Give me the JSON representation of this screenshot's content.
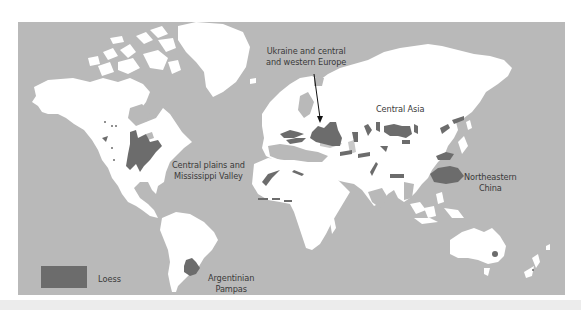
{
  "map": {
    "type": "world map",
    "colors": {
      "ocean": "#b9b9b9",
      "land": "#ffffff",
      "loess": "#6c6c6c",
      "inland_sea": "#c9c9c9"
    },
    "labels": [
      {
        "id": "europe",
        "line1": "Ukraine and central",
        "line2": "and western Europe"
      },
      {
        "id": "central-asia",
        "line1": "Central Asia",
        "line2": ""
      },
      {
        "id": "north-america",
        "line1": "Central plains and",
        "line2": "Mississippi Valley"
      },
      {
        "id": "china",
        "line1": "Northeastern",
        "line2": "China"
      },
      {
        "id": "argentina",
        "line1": "Argentinian",
        "line2": "Pampas"
      }
    ],
    "legend": {
      "items": [
        {
          "label": "Loess",
          "color": "#6c6c6c"
        }
      ]
    }
  }
}
